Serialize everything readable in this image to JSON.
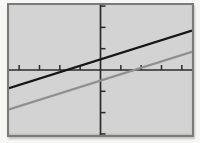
{
  "window": {
    "description": "Graphing calculator screen plot of two parallel lines"
  },
  "colors": {
    "page_background": "#f7f7f6",
    "screen_background": "#d3d3d3",
    "screen_frame": "#7a7a7a",
    "axis": "#2b2b2b",
    "upper_line": "#161616",
    "lower_line": "#8f8f8f"
  },
  "chart_data": {
    "type": "line",
    "title": "",
    "xlabel": "",
    "ylabel": "",
    "x_range": [
      -4.5,
      4.5
    ],
    "y_range": [
      -3.05,
      3.05
    ],
    "tick_interval": 1,
    "tick_length_px": 5,
    "grid": false,
    "legend": false,
    "series": [
      {
        "name": "upper-line",
        "color": "#161616",
        "slope": 0.3,
        "y_intercept": 0.5,
        "x_intercept": -1.7,
        "points": [
          [
            -4.5,
            -0.85
          ],
          [
            4.5,
            1.85
          ]
        ]
      },
      {
        "name": "lower-line",
        "color": "#8f8f8f",
        "slope": 0.3,
        "y_intercept": -0.5,
        "x_intercept": 1.6,
        "points": [
          [
            -4.5,
            -1.85
          ],
          [
            4.5,
            0.85
          ]
        ]
      }
    ]
  }
}
